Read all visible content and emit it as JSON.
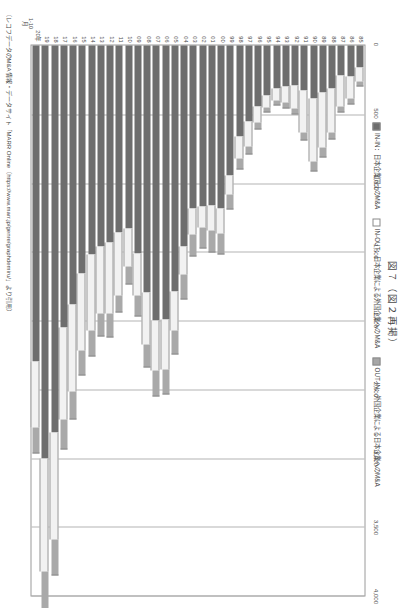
{
  "figure": {
    "title": "図７（図２再掲）",
    "source_note": "（レコフデータのM&A情報・データサイト「MARR Online（https://www.marr.jp/genre/graphdemiru/」より引用）",
    "axis_unit_note_line1": "1-10",
    "axis_unit_note_line2": "月"
  },
  "legend": [
    {
      "key": "IN-IN",
      "label": "IN-IN：日本企業同士のM&A",
      "color": "#6e6e6e"
    },
    {
      "key": "IN-OUT",
      "label": "IN-OUT：日本企業による外国企業へのM&A",
      "color": "#f2f2f2"
    },
    {
      "key": "OUT-IN",
      "label": "OUT-IN：外国企業による日本企業へのM&A",
      "color": "#a9a9a9"
    }
  ],
  "chart_data": {
    "type": "bar",
    "title": "図７（図２再掲）",
    "orientation": "horizontal-stacked",
    "xlabel": "",
    "ylabel": "",
    "xlim": [
      0,
      4000
    ],
    "xticks": [
      "0",
      "500",
      "1,000",
      "1,500",
      "2,000",
      "2,500",
      "3,000",
      "3,500",
      "4,000"
    ],
    "xtick_values": [
      0,
      500,
      1000,
      1500,
      2000,
      2500,
      3000,
      3500,
      4000
    ],
    "grid": true,
    "legend_position": "top",
    "categories": [
      "85",
      "86",
      "87",
      "88",
      "89",
      "90",
      "91",
      "92",
      "93",
      "94",
      "95",
      "96",
      "97",
      "98",
      "99",
      "00",
      "01",
      "02",
      "03",
      "04",
      "05",
      "06",
      "07",
      "08",
      "09",
      "10",
      "11",
      "12",
      "13",
      "14",
      "15",
      "16",
      "17",
      "18",
      "19",
      "20年"
    ],
    "series": [
      {
        "name": "IN-IN",
        "color": "#6e6e6e",
        "values": [
          163,
          226,
          219,
          315,
          340,
          383,
          330,
          288,
          298,
          310,
          363,
          441,
          551,
          660,
          947,
          1183,
          1162,
          1171,
          1188,
          1459,
          1790,
          1992,
          1999,
          1799,
          1516,
          1332,
          1362,
          1432,
          1460,
          1518,
          1657,
          1884,
          2050,
          2814,
          3000,
          2300
        ]
      },
      {
        "name": "IN-OUT",
        "color": "#f2f2f2",
        "values": [
          100,
          163,
          228,
          315,
          405,
          463,
          300,
          170,
          118,
          92,
          87,
          118,
          180,
          165,
          134,
          183,
          181,
          150,
          184,
          205,
          282,
          366,
          367,
          377,
          300,
          274,
          455,
          515,
          490,
          557,
          560,
          635,
          672,
          777,
          826,
          480
        ]
      },
      {
        "name": "OUT-IN",
        "color": "#a9a9a9",
        "values": [
          26,
          32,
          35,
          45,
          59,
          65,
          52,
          38,
          32,
          27,
          30,
          44,
          55,
          68,
          105,
          145,
          154,
          149,
          156,
          178,
          170,
          174,
          179,
          156,
          145,
          126,
          118,
          170,
          159,
          180,
          176,
          195,
          209,
          259,
          270,
          180
        ]
      }
    ],
    "total_note": "件数（件）"
  }
}
